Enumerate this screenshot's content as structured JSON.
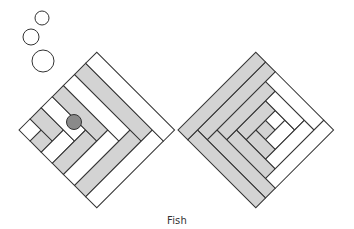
{
  "caption": "Fish",
  "colors": {
    "stroke": "#333333",
    "light": "#ffffff",
    "dark": "#d3d3d3",
    "eye": "#8a8a8a",
    "background": "#ffffff"
  },
  "bubbles": [
    {
      "cx": 42,
      "cy": 18,
      "r": 7
    },
    {
      "cx": 31,
      "cy": 37,
      "r": 8
    },
    {
      "cx": 43,
      "cy": 61,
      "r": 11
    }
  ],
  "eye": {
    "cx": 74,
    "cy": 122,
    "r": 7.5
  },
  "left_block": {
    "name": "fish-body",
    "origin": [
      19,
      130
    ],
    "size": 110,
    "pattern": "corner-log-cabin",
    "rings": 7,
    "ring_colors": [
      "light",
      "dark",
      "light",
      "dark",
      "light",
      "dark",
      "light"
    ]
  },
  "right_block": {
    "name": "fish-tail",
    "origin": [
      178,
      130
    ],
    "size": 110,
    "pattern": "classic-log-cabin",
    "grid": 8
  }
}
